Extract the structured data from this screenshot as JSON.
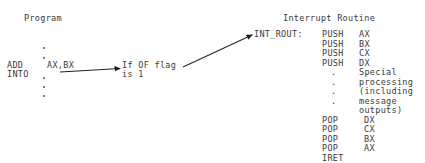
{
  "program": {
    "title": "Program",
    "instruction1": {
      "mnemonic": "ADD",
      "operands": "AX,BX"
    },
    "instruction2": {
      "mnemonic": "INTO"
    },
    "condition_line1": "If OF flag",
    "condition_line2": "is 1"
  },
  "routine": {
    "title": "Interrupt Routine",
    "label": "INT_ROUT:",
    "rows": [
      {
        "op": "PUSH",
        "arg": "AX"
      },
      {
        "op": "PUSH",
        "arg": "BX"
      },
      {
        "op": "PUSH",
        "arg": "CX"
      },
      {
        "op": "PUSH",
        "arg": "DX"
      },
      {
        "op": ".",
        "arg": "Special"
      },
      {
        "op": ".",
        "arg": "processing"
      },
      {
        "op": ".",
        "arg": "(including"
      },
      {
        "op": ".",
        "arg": "message"
      },
      {
        "op": "",
        "arg": "outputs)"
      },
      {
        "op": "POP",
        "arg": "DX"
      },
      {
        "op": "POP",
        "arg": "CX"
      },
      {
        "op": "POP",
        "arg": "BX"
      },
      {
        "op": "POP",
        "arg": "AX"
      },
      {
        "op": "IRET",
        "arg": ""
      }
    ]
  }
}
